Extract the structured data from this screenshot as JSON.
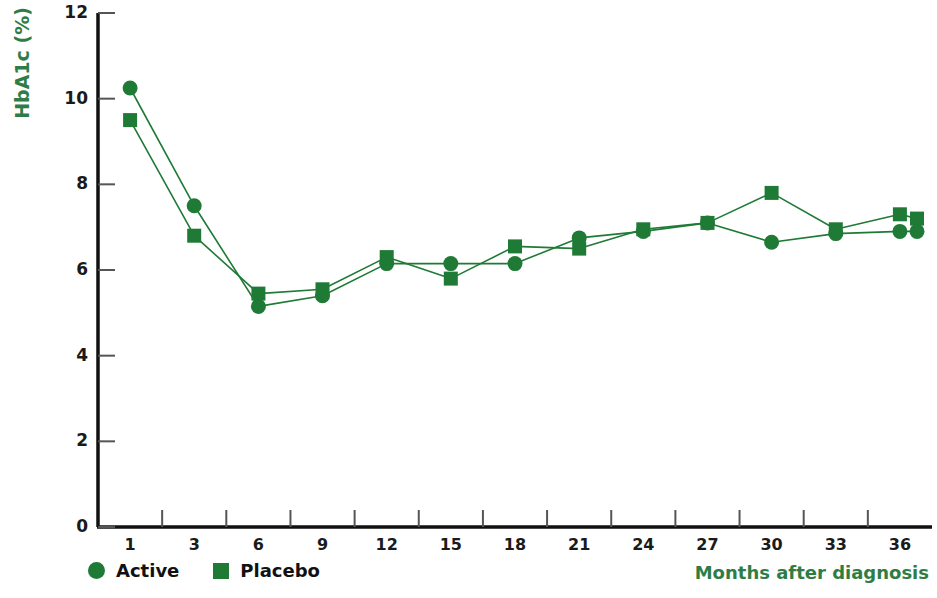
{
  "chart_data": {
    "type": "line",
    "title": "",
    "xlabel": "Months after diagnosis",
    "ylabel": "HbA1c (%)",
    "xlim": [
      0,
      13
    ],
    "ylim": [
      0,
      12
    ],
    "yticks": [
      0,
      2,
      4,
      6,
      8,
      10,
      12
    ],
    "xticks": [
      1,
      3,
      6,
      9,
      12,
      15,
      18,
      21,
      24,
      27,
      30,
      33,
      36
    ],
    "grid": false,
    "legend_position": "bottom-left",
    "x": [
      1,
      3,
      6,
      9,
      12,
      15,
      18,
      21,
      24,
      27,
      30,
      33,
      36
    ],
    "series": [
      {
        "name": "Active",
        "marker": "circle",
        "color": "#1f7a36",
        "values": [
          10.25,
          7.5,
          5.15,
          5.4,
          6.15,
          6.15,
          6.15,
          6.75,
          6.9,
          7.1,
          6.65,
          6.85,
          6.9
        ]
      },
      {
        "name": "Placebo",
        "marker": "square",
        "color": "#1f7a36",
        "values": [
          9.5,
          6.8,
          5.45,
          5.55,
          6.3,
          5.8,
          6.55,
          6.5,
          6.95,
          7.1,
          7.8,
          6.95,
          7.3
        ]
      }
    ],
    "series_extra_points": {
      "Active": [
        {
          "x": 36.8,
          "y": 6.9
        }
      ],
      "Placebo": [
        {
          "x": 36.8,
          "y": 7.2
        }
      ]
    }
  },
  "axis": {
    "y_tick_labels": [
      "12",
      "10",
      "8",
      "6",
      "4",
      "2",
      "0"
    ],
    "x_tick_labels": [
      "1",
      "3",
      "6",
      "9",
      "12",
      "15",
      "18",
      "21",
      "24",
      "27",
      "30",
      "33",
      "36"
    ],
    "y_title": "HbA1c (%)",
    "x_title": "Months after diagnosis"
  },
  "legend": {
    "items": [
      {
        "label": "Active",
        "marker": "circle"
      },
      {
        "label": "Placebo",
        "marker": "square"
      }
    ]
  },
  "colors": {
    "series_green": "#1f7a36",
    "label_green": "#2f7d46",
    "axis_black": "#111111"
  }
}
